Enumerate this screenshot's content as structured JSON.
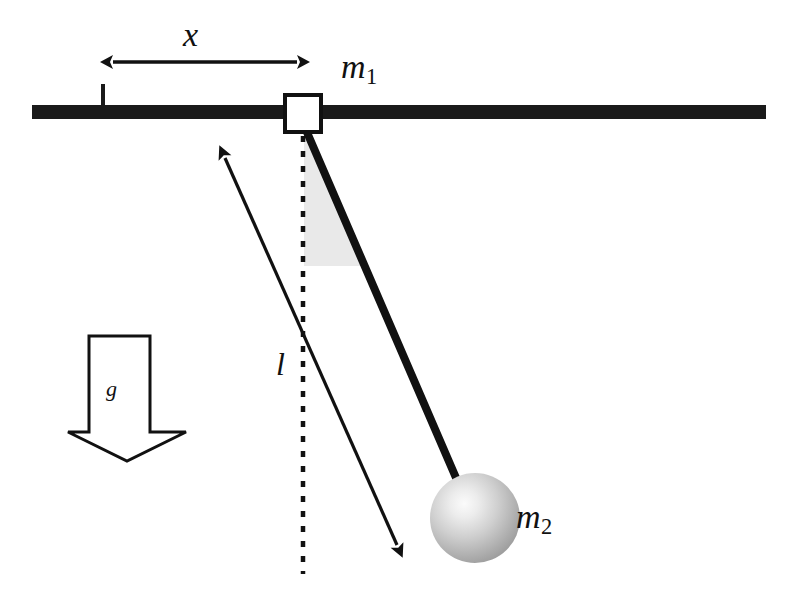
{
  "figure": {
    "background_color": "#ffffff",
    "width": 808,
    "height": 608
  },
  "labels": {
    "displacement": {
      "text": "x",
      "name": "displacement-label"
    },
    "cart_mass": {
      "base": "m",
      "subscript": "1",
      "name": "cart-mass-label"
    },
    "bob_mass": {
      "base": "m",
      "subscript": "2",
      "name": "bob-mass-label"
    },
    "rod_length": {
      "text": "l",
      "name": "rod-length-label"
    },
    "gravity": {
      "text": "g",
      "name": "gravity-label"
    }
  },
  "elements": {
    "rail": {
      "name": "horizontal-rail",
      "color": "#1a1a1a",
      "x1": 32,
      "x2": 766,
      "y": 105,
      "thickness": 14
    },
    "origin_tick": {
      "name": "origin-tick-mark",
      "color": "#1a1a1a",
      "x": 103,
      "y_top": 84,
      "y_bottom": 106,
      "thickness": 4
    },
    "cart_block": {
      "name": "cart-block",
      "fill": "#ffffff",
      "stroke": "#111111",
      "x": 285,
      "y": 95,
      "width": 36,
      "height": 37,
      "stroke_width": 4
    },
    "displacement_arrow": {
      "name": "displacement-dimension-arrow",
      "color": "#111111",
      "x1": 113,
      "x2": 297,
      "y": 62,
      "double_headed": true
    },
    "vertical_dashed": {
      "name": "vertical-reference-line",
      "color": "#111111",
      "x": 303,
      "y1": 136,
      "y2": 574,
      "dash": "6 9",
      "thickness": 4
    },
    "rod": {
      "name": "pendulum-rod",
      "color": "#111111",
      "x1": 306,
      "y1": 131,
      "x2": 463,
      "y2": 494,
      "thickness": 8
    },
    "angle_wedge": {
      "name": "angle-shading-wedge",
      "fill": "#e9e9e9",
      "apex_x": 304,
      "apex_y": 134,
      "end_y": 266
    },
    "length_arrow": {
      "name": "rod-length-dimension-arrow",
      "color": "#111111",
      "x1": 222,
      "y1": 152,
      "x2": 400,
      "y2": 551,
      "double_headed": true
    },
    "bob": {
      "name": "pendulum-bob",
      "cx": 475,
      "cy": 518,
      "r": 45,
      "highlight_color": "#f2f2f2",
      "mid_color": "#b9b9b9",
      "edge_color": "#8d8d8d"
    },
    "gravity_arrow": {
      "name": "gravity-block-arrow",
      "fill": "#ffffff",
      "stroke": "#111111",
      "stroke_width": 3,
      "shaft_left": 89,
      "shaft_right": 150,
      "top": 336,
      "shaft_bottom": 432,
      "head_left": 68,
      "head_right": 186,
      "tip_y": 461
    }
  }
}
